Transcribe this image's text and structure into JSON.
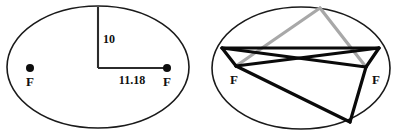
{
  "figure": {
    "caption": "",
    "background_color": "#ffffff",
    "stroke_color": "#1a1a1a",
    "gray_color": "#a8a8a8",
    "left_diagram": {
      "name": "ellipse-with-semi-axes",
      "focus_left_label": "F",
      "focus_right_label": "F",
      "semi_minor_label": "10",
      "semi_major_label": "11.18",
      "ellipse": {
        "cx": 98,
        "cy": 67,
        "rx": 91,
        "ry": 61
      },
      "focus_left": {
        "x": 30,
        "y": 68,
        "r": 4
      },
      "focus_right": {
        "x": 167,
        "y": 68,
        "r": 4
      },
      "vertical_dim": {
        "x1": 98,
        "y1": 7,
        "x2": 98,
        "y2": 68
      },
      "horizontal_dim": {
        "x1": 98,
        "y1": 68,
        "x2": 167,
        "y2": 68
      },
      "semi_minor_label_pos": {
        "x": 103,
        "y": 43
      },
      "semi_major_label_pos": {
        "x": 132,
        "y": 84
      },
      "focus_left_label_pos": {
        "x": 30,
        "y": 86
      },
      "focus_right_label_pos": {
        "x": 167,
        "y": 86
      }
    },
    "right_diagram": {
      "name": "ellipse-with-inscribed-triangles",
      "focus_left_label": "F",
      "focus_right_label": "F",
      "ellipse": {
        "cx": 301,
        "cy": 68,
        "rx": 89,
        "ry": 61
      },
      "focus_left": {
        "x": 236,
        "y": 66
      },
      "focus_right": {
        "x": 366,
        "y": 67
      },
      "vertex_top": {
        "x": 320,
        "y": 8
      },
      "vertex_left": {
        "x": 222,
        "y": 48
      },
      "vertex_right": {
        "x": 379,
        "y": 48
      },
      "vertex_bottom": {
        "x": 350,
        "y": 122
      },
      "focus_left_label_pos": {
        "x": 234,
        "y": 84
      },
      "focus_right_label_pos": {
        "x": 376,
        "y": 84
      },
      "gray_segments": [
        {
          "x1": 320,
          "y1": 8,
          "x2": 236,
          "y2": 66
        },
        {
          "x1": 320,
          "y1": 8,
          "x2": 366,
          "y2": 67
        }
      ],
      "dark_segments": [
        {
          "x1": 222,
          "y1": 48,
          "x2": 379,
          "y2": 48
        },
        {
          "x1": 222,
          "y1": 48,
          "x2": 366,
          "y2": 67
        },
        {
          "x1": 379,
          "y1": 48,
          "x2": 236,
          "y2": 66
        },
        {
          "x1": 222,
          "y1": 48,
          "x2": 236,
          "y2": 66
        },
        {
          "x1": 379,
          "y1": 48,
          "x2": 366,
          "y2": 67
        },
        {
          "x1": 236,
          "y1": 66,
          "x2": 350,
          "y2": 122
        },
        {
          "x1": 350,
          "y1": 122,
          "x2": 366,
          "y2": 67
        }
      ]
    }
  }
}
